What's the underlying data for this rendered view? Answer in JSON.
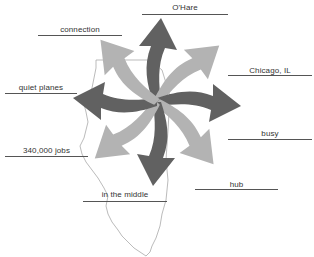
{
  "diagram": {
    "type": "pinwheel-word-map",
    "center_shape": "Illinois state outline",
    "arrow_count": 8,
    "colors": {
      "arrow_dark": "#616161",
      "arrow_light": "#b3b3b3",
      "outline": "#aaaaaa",
      "label_text": "#333333",
      "label_rule": "#555555"
    },
    "labels": [
      {
        "id": "ohare",
        "text": "O'Hare"
      },
      {
        "id": "connection",
        "text": "connection"
      },
      {
        "id": "chicago",
        "text": "Chicago, IL"
      },
      {
        "id": "quiet_planes",
        "text": "quiet planes"
      },
      {
        "id": "busy",
        "text": "busy"
      },
      {
        "id": "jobs",
        "text": "340,000 jobs"
      },
      {
        "id": "hub",
        "text": "hub"
      },
      {
        "id": "middle",
        "text": "in the middle"
      }
    ]
  }
}
